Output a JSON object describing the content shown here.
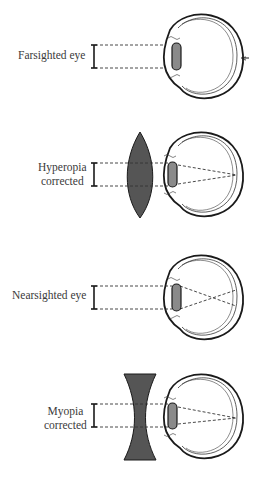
{
  "diagram": {
    "panels": [
      {
        "id": "farsighted",
        "label": "Farsighted eye",
        "corrective_lens": null,
        "focus": "behind retina"
      },
      {
        "id": "hyperopia-corrected",
        "label_line1": "Hyperopia",
        "label_line2": "corrected",
        "corrective_lens": "convex",
        "focus": "on retina"
      },
      {
        "id": "nearsighted",
        "label": "Nearsighted eye",
        "corrective_lens": null,
        "focus": "in front of retina"
      },
      {
        "id": "myopia-corrected",
        "label_line1": "Myopia",
        "label_line2": "corrected",
        "corrective_lens": "concave",
        "focus": "on retina"
      }
    ],
    "colors": {
      "outline": "#1a1a1a",
      "lens_fill": "#555555",
      "eye_lens_fill": "#8a8a8a",
      "text": "#3a3a3a"
    }
  }
}
